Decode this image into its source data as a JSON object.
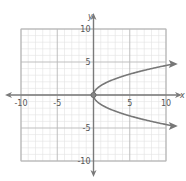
{
  "chart_data": {
    "type": "line",
    "title": "",
    "xlabel": "x",
    "ylabel": "y",
    "xlim": [
      -10,
      10
    ],
    "ylim": [
      -10,
      10
    ],
    "grid": true,
    "minor_grid_step": 1,
    "major_grid_step": 5,
    "x_ticks": [
      -10,
      -5,
      5,
      10
    ],
    "y_ticks": [
      10,
      5,
      -5,
      -10
    ],
    "x_tick_labels": [
      "-10",
      "-5",
      "5",
      "10"
    ],
    "y_tick_labels": [
      "10",
      "5",
      "-5",
      "-10"
    ],
    "legend": null,
    "equation": "y = ±√(2x)",
    "series": [
      {
        "name": "upper branch",
        "x": [
          0,
          0.5,
          1,
          2,
          3,
          4,
          5,
          6,
          7,
          8,
          9,
          10
        ],
        "y": [
          0,
          1,
          1.41,
          2,
          2.45,
          2.83,
          3.16,
          3.46,
          3.74,
          4,
          4.24,
          4.47
        ],
        "arrow_at_end": true
      },
      {
        "name": "lower branch",
        "x": [
          0,
          0.5,
          1,
          2,
          3,
          4,
          5,
          6,
          7,
          8,
          9,
          10
        ],
        "y": [
          0,
          -1,
          -1.41,
          -2,
          -2.45,
          -2.83,
          -3.16,
          -3.46,
          -3.74,
          -4,
          -4.24,
          -4.47
        ],
        "arrow_at_end": true
      }
    ],
    "points": [
      {
        "label": "vertex",
        "x": 0,
        "y": 0
      }
    ]
  },
  "colors": {
    "minor_grid": "#e2e2e2",
    "major_grid": "#b8b8b8",
    "axis": "#7a7a7a",
    "curve": "#777777",
    "text": "#555555"
  }
}
